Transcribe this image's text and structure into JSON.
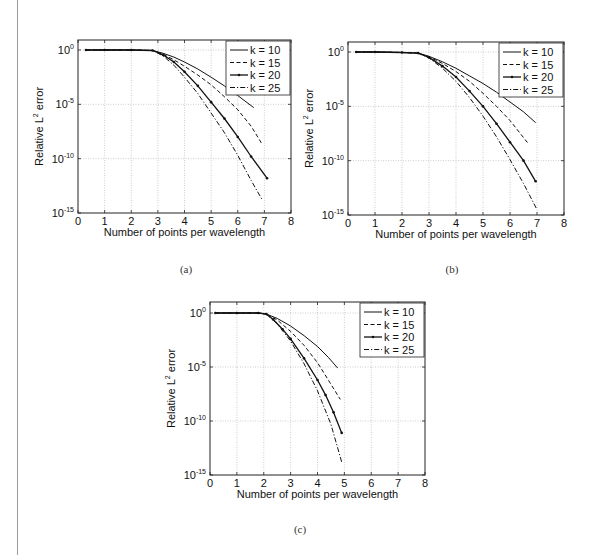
{
  "chart_data": [
    {
      "type": "line",
      "panel": "a",
      "caption": "(a)",
      "xlabel": "Number of points per wavelength",
      "ylabel": "Relative L2 error",
      "xlim": [
        0,
        8
      ],
      "ylim_log10": [
        -15,
        0.6
      ],
      "yscale": "log",
      "xticks": [
        "0",
        "1",
        "2",
        "3",
        "4",
        "5",
        "6",
        "7",
        "8"
      ],
      "yticks": [
        "10^0",
        "10^-5",
        "10^-10",
        "10^-15"
      ],
      "grid": true,
      "legend_position": "upper right",
      "series": [
        {
          "name": "k = 10",
          "style": "solid",
          "x": [
            0.3,
            1,
            2,
            2.8,
            3.2,
            3.6,
            4,
            4.5,
            5,
            5.5,
            6,
            6.6
          ],
          "log10_y": [
            0,
            0,
            0,
            -0.05,
            -0.3,
            -0.65,
            -1.1,
            -1.75,
            -2.5,
            -3.3,
            -4.2,
            -5.3
          ]
        },
        {
          "name": "k = 15",
          "style": "dashed",
          "x": [
            0.3,
            1,
            2,
            2.8,
            3.2,
            3.6,
            4,
            4.5,
            5,
            5.5,
            6,
            6.5,
            6.9
          ],
          "log10_y": [
            0,
            0,
            0,
            -0.05,
            -0.4,
            -0.9,
            -1.5,
            -2.3,
            -3.2,
            -4.3,
            -5.5,
            -7.0,
            -8.6
          ]
        },
        {
          "name": "k = 20",
          "style": "solid-dot",
          "x": [
            0.3,
            1,
            2,
            2.8,
            3.2,
            3.6,
            4,
            4.5,
            5,
            5.5,
            6,
            6.5,
            7.1
          ],
          "log10_y": [
            0,
            0,
            0,
            -0.05,
            -0.45,
            -1.1,
            -2.0,
            -3.3,
            -4.8,
            -6.3,
            -8.0,
            -9.8,
            -11.8
          ]
        },
        {
          "name": "k = 25",
          "style": "dash-dot",
          "x": [
            0.3,
            1,
            2,
            2.8,
            3.2,
            3.6,
            4,
            4.5,
            5,
            5.5,
            6,
            6.5,
            6.9
          ],
          "log10_y": [
            0,
            0,
            0,
            -0.05,
            -0.55,
            -1.4,
            -2.5,
            -4.0,
            -5.8,
            -7.6,
            -9.7,
            -12.0,
            -13.7
          ]
        }
      ]
    },
    {
      "type": "line",
      "panel": "b",
      "caption": "(b)",
      "xlabel": "Number of points per wavelength",
      "ylabel": "Relative L2 error",
      "xlim": [
        0,
        8
      ],
      "ylim_log10": [
        -15,
        0.6
      ],
      "yscale": "log",
      "xticks": [
        "0",
        "1",
        "2",
        "3",
        "4",
        "5",
        "6",
        "7",
        "8"
      ],
      "yticks": [
        "10^0",
        "10^-5",
        "10^-10",
        "10^-15"
      ],
      "grid": true,
      "legend_position": "upper right",
      "series": [
        {
          "name": "k = 10",
          "style": "solid",
          "x": [
            0.3,
            1,
            2,
            2.6,
            3,
            3.5,
            4,
            4.5,
            5,
            5.5,
            6,
            6.5,
            6.95
          ],
          "log10_y": [
            0,
            0,
            -0.05,
            -0.1,
            -0.4,
            -0.9,
            -1.5,
            -2.2,
            -2.9,
            -3.7,
            -4.6,
            -5.5,
            -6.5
          ]
        },
        {
          "name": "k = 15",
          "style": "dashed",
          "x": [
            0.3,
            1,
            2,
            2.6,
            3,
            3.5,
            4,
            4.5,
            5,
            5.5,
            6,
            6.7
          ],
          "log10_y": [
            0,
            0,
            -0.05,
            -0.1,
            -0.45,
            -1.05,
            -1.8,
            -2.7,
            -3.8,
            -5.0,
            -6.3,
            -8.5
          ]
        },
        {
          "name": "k = 20",
          "style": "solid-dot",
          "x": [
            0.3,
            1,
            2,
            2.6,
            3,
            3.5,
            4,
            4.5,
            5,
            5.5,
            6,
            6.5,
            6.95
          ],
          "log10_y": [
            0,
            0,
            -0.05,
            -0.1,
            -0.5,
            -1.3,
            -2.3,
            -3.6,
            -5.0,
            -6.6,
            -8.3,
            -10.0,
            -11.9
          ]
        },
        {
          "name": "k = 25",
          "style": "dash-dot",
          "x": [
            0.3,
            1,
            2,
            2.6,
            3,
            3.5,
            4,
            4.5,
            5,
            5.5,
            6,
            6.5,
            7.0
          ],
          "log10_y": [
            0,
            0,
            -0.05,
            -0.1,
            -0.55,
            -1.5,
            -2.7,
            -4.2,
            -5.9,
            -7.8,
            -9.9,
            -12.1,
            -14.5
          ]
        }
      ]
    },
    {
      "type": "line",
      "panel": "c",
      "caption": "(c)",
      "xlabel": "Number of points per wavelength",
      "ylabel": "Relative L2 error",
      "xlim": [
        0,
        8
      ],
      "ylim_log10": [
        -15,
        0.6
      ],
      "yscale": "log",
      "xticks": [
        "0",
        "1",
        "2",
        "3",
        "4",
        "5",
        "6",
        "7",
        "8"
      ],
      "yticks": [
        "10^0",
        "10^-5",
        "10^-10",
        "10^-15"
      ],
      "grid": true,
      "legend_position": "upper right",
      "series": [
        {
          "name": "k = 10",
          "style": "solid",
          "x": [
            0.2,
            1,
            1.8,
            2.1,
            2.5,
            3,
            3.5,
            4,
            4.4,
            4.75
          ],
          "log10_y": [
            0,
            0,
            0,
            -0.1,
            -0.5,
            -1.2,
            -2.1,
            -3.1,
            -4.1,
            -5.1
          ]
        },
        {
          "name": "k = 15",
          "style": "dashed",
          "x": [
            0.2,
            1,
            1.8,
            2.1,
            2.5,
            3,
            3.5,
            4,
            4.4,
            4.85
          ],
          "log10_y": [
            0,
            0,
            0,
            -0.1,
            -0.65,
            -1.7,
            -3.0,
            -4.6,
            -6.2,
            -8.0
          ]
        },
        {
          "name": "k = 20",
          "style": "solid-dot",
          "x": [
            0.2,
            1,
            1.8,
            2.1,
            2.35,
            2.7,
            3,
            3.5,
            4,
            4.3,
            4.6,
            4.9
          ],
          "log10_y": [
            0,
            0,
            0,
            -0.1,
            -0.6,
            -1.5,
            -2.4,
            -4.2,
            -6.2,
            -7.6,
            -9.2,
            -11.1
          ]
        },
        {
          "name": "k = 25",
          "style": "dash-dot",
          "x": [
            0.2,
            1,
            1.8,
            2.1,
            2.5,
            3,
            3.5,
            4,
            4.5,
            4.9
          ],
          "log10_y": [
            0,
            0,
            0,
            -0.1,
            -1.0,
            -2.6,
            -4.7,
            -7.2,
            -10.3,
            -13.8
          ]
        }
      ]
    }
  ],
  "panels": [
    {
      "caption": "(a)",
      "xlabel": "Number of points per wavelength",
      "ylabel": "Relative L",
      "ylabel_sup": "2",
      "ylabel_tail": " error"
    },
    {
      "caption": "(b)",
      "xlabel": "Number of points per wavelength",
      "ylabel": "Relative L",
      "ylabel_sup": "2",
      "ylabel_tail": " error"
    },
    {
      "caption": "(c)",
      "xlabel": "Number of points per wavelength",
      "ylabel": "Relative L",
      "ylabel_sup": "2",
      "ylabel_tail": " error"
    }
  ],
  "colors": {
    "line": "#111111",
    "grid": "#b8b8b8",
    "axis": "#222222",
    "margin_line": "#9a9a9a"
  }
}
